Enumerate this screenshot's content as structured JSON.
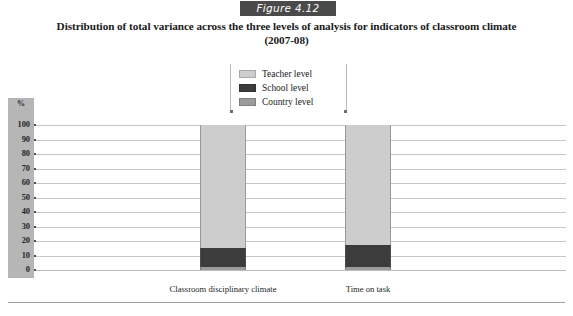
{
  "figure": {
    "badge_label": "Figure 4.12"
  },
  "title": {
    "line1": "Distribution of total variance across the three levels of analysis for indicators of classroom climate",
    "line2": "(2007-08)"
  },
  "legend": {
    "items": [
      {
        "label": "Teacher level",
        "color": "#cdcdcd",
        "icon": "legend-swatch-icon"
      },
      {
        "label": "School level",
        "color": "#3c3c3c",
        "icon": "legend-swatch-icon"
      },
      {
        "label": "Country level",
        "color": "#9b9b9b",
        "icon": "legend-swatch-icon"
      }
    ]
  },
  "axis": {
    "y_unit": "%",
    "ticks": [
      "100",
      "90",
      "80",
      "70",
      "60",
      "50",
      "40",
      "30",
      "20",
      "10",
      "0"
    ]
  },
  "chart_data": {
    "type": "bar",
    "stacked": true,
    "title": "Distribution of total variance across the three levels of analysis for indicators of classroom climate (2007-08)",
    "xlabel": "",
    "ylabel": "%",
    "ylim": [
      0,
      100
    ],
    "grid": true,
    "legend_position": "top-center",
    "categories": [
      "Classroom disciplinary climate",
      "Time on task"
    ],
    "series": [
      {
        "name": "Teacher level",
        "color": "#cdcdcd",
        "values": [
          85,
          83
        ]
      },
      {
        "name": "School level",
        "color": "#3c3c3c",
        "values": [
          13,
          15
        ]
      },
      {
        "name": "Country level",
        "color": "#9b9b9b",
        "values": [
          2,
          2
        ]
      }
    ]
  }
}
